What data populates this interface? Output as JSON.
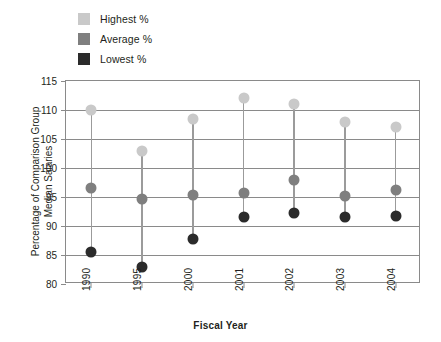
{
  "chart_data": {
    "type": "scatter",
    "title": "",
    "xlabel": "Fiscal Year",
    "ylabel": "Percentage of Comparison Group Median Salaries",
    "ylabel_line1": "Percentage of Comparison Group",
    "ylabel_line2": "Median Salaries",
    "categories": [
      "1990",
      "1995",
      "2000",
      "2001",
      "2002",
      "2003",
      "2004"
    ],
    "ylim": [
      80,
      115
    ],
    "yticks": [
      80,
      85,
      90,
      95,
      100,
      105,
      110,
      115
    ],
    "grid": true,
    "legend_position": "top-left",
    "series": [
      {
        "name": "Highest %",
        "key": "highest",
        "color": "#c9c9c9",
        "values": [
          110.0,
          103.0,
          108.5,
          112.0,
          111.0,
          108.0,
          107.0
        ]
      },
      {
        "name": "Average %",
        "key": "average",
        "color": "#7f7f7f",
        "values": [
          96.5,
          94.7,
          95.3,
          95.7,
          98.0,
          95.2,
          96.2
        ]
      },
      {
        "name": "Lowest %",
        "key": "lowest",
        "color": "#2b2b2b",
        "values": [
          85.5,
          83.0,
          87.8,
          91.5,
          92.2,
          91.6,
          91.8
        ]
      }
    ],
    "stem_color": "#9b9b9b",
    "axis_color": "#8a8a8a"
  },
  "legend": {
    "items": [
      {
        "label": "Highest %",
        "color": "#c9c9c9"
      },
      {
        "label": "Average %",
        "color": "#7f7f7f"
      },
      {
        "label": "Lowest %",
        "color": "#2b2b2b"
      }
    ]
  }
}
